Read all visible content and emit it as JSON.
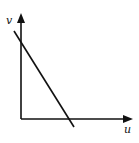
{
  "diagram": {
    "type": "line-graph-sketch",
    "axes": {
      "x_label": "u",
      "y_label": "v",
      "origin": [
        21,
        119
      ],
      "x_axis_end": [
        133,
        119
      ],
      "y_axis_end": [
        21,
        13
      ]
    },
    "line": {
      "description": "straight line with negative slope crossing v-axis and u-axis",
      "start": [
        14,
        31
      ],
      "end": [
        74,
        127
      ]
    },
    "colors": {
      "stroke": "#111111",
      "background": "#ffffff"
    }
  }
}
